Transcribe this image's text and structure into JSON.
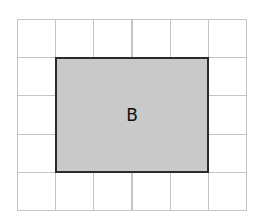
{
  "diagram": {
    "grid": {
      "columns": 6,
      "rows": 5,
      "cell_size_px": 38.2,
      "line_color": "#c4c4c4"
    },
    "shape": {
      "label": "B",
      "col_start": 1,
      "col_span": 4,
      "row_start": 1,
      "row_span": 3,
      "fill": "#c9c9c9",
      "border": "#2a2a2a"
    }
  }
}
